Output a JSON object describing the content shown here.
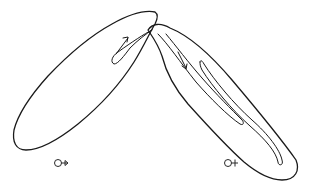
{
  "diagram": {
    "left_organism": {
      "symbol": "male",
      "arrow_direction": "up-right toward junction"
    },
    "right_organism": {
      "symbol": "female",
      "arrow_direction": "down-right away from junction"
    },
    "colors": {
      "stroke": "#1a1a1a",
      "background": "#ffffff"
    }
  }
}
